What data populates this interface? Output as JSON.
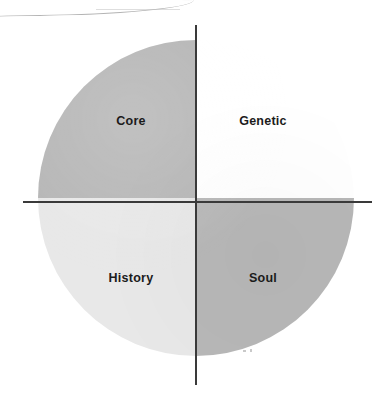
{
  "diagram": {
    "type": "quadrant-circle",
    "title": "",
    "shape": "circle divided into four quadrants by vertical and horizontal axes",
    "axes": {
      "vertical_axis_name": "vertical-axis",
      "horizontal_axis_name": "horizontal-axis",
      "color": "#3a3a3a"
    },
    "quadrants": [
      {
        "position": "upper-left",
        "label": "Core",
        "fill": "#b6b6b6",
        "filled": true
      },
      {
        "position": "upper-right",
        "label": "Genetic",
        "fill": "#ffffff",
        "filled": false
      },
      {
        "position": "lower-left",
        "label": "History",
        "fill": "#e8e8e8",
        "filled": true
      },
      {
        "position": "lower-right",
        "label": "Soul",
        "fill": "#b8b8b8",
        "filled": true
      }
    ],
    "artifacts": {
      "top_streak": "faint curved scan line across the top edge",
      "specks": "two tiny gray specks near the lower-center of the circle"
    },
    "colors": {
      "background": "#ffffff",
      "axis": "#3a3a3a",
      "label_text": "#1b1b1b",
      "dark_gray": "#b6b6b6",
      "light_gray": "#e8e8e8"
    }
  }
}
